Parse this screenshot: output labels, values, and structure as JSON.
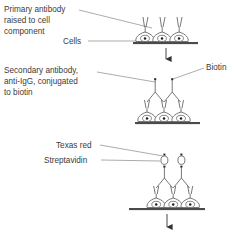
{
  "figure": {
    "background_color": "#ffffff",
    "line_color": "#555555",
    "text_color": "#3b3b3b",
    "substrate_color": "#4a4a4a"
  },
  "panels": [
    {
      "id": "panel-primary-antibody",
      "step": 1,
      "labels": [
        {
          "name": "primary-antibody-label",
          "lines": [
            "Primary antibody",
            "raised to cell",
            "component"
          ]
        },
        {
          "name": "cells-label",
          "lines": [
            "Cells"
          ]
        }
      ],
      "elements": [
        "cells",
        "substrate",
        "primary-antibodies",
        "step-arrow"
      ]
    },
    {
      "id": "panel-secondary-antibody",
      "step": 2,
      "labels": [
        {
          "name": "secondary-antibody-label",
          "lines": [
            "Secondary antibody,",
            "anti-IgG, conjugated",
            "to biotin"
          ]
        },
        {
          "name": "biotin-label",
          "lines": [
            "Biotin"
          ]
        }
      ],
      "elements": [
        "cells",
        "substrate",
        "primary-antibodies",
        "secondary-antibodies",
        "biotin-dots",
        "step-arrow"
      ]
    },
    {
      "id": "panel-streptavidin",
      "step": 3,
      "labels": [
        {
          "name": "texas-red-label",
          "lines": [
            "Texas red"
          ]
        },
        {
          "name": "streptavidin-label",
          "lines": [
            "Streptavidin"
          ]
        }
      ],
      "elements": [
        "cells",
        "substrate",
        "primary-antibodies",
        "secondary-antibodies",
        "biotin-dots",
        "streptavidin-circles",
        "texas-red-dots",
        "step-arrow"
      ]
    }
  ],
  "text": {
    "primary_antibody_line1": "Primary antibody",
    "primary_antibody_line2": "raised to cell",
    "primary_antibody_line3": "component",
    "cells": "Cells",
    "secondary_antibody_line1": "Secondary antibody,",
    "secondary_antibody_line2": "anti-IgG, conjugated",
    "secondary_antibody_line3": "to biotin",
    "biotin": "Biotin",
    "texas_red": "Texas red",
    "streptavidin": "Streptavidin"
  }
}
